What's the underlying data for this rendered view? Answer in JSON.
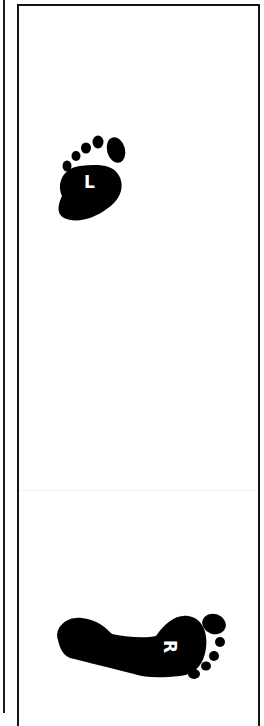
{
  "diagram": {
    "type": "footprint-placement-guide",
    "colors": {
      "ink": "#000000",
      "background": "#ffffff",
      "label": "#ffffff"
    },
    "footprints": [
      {
        "id": "left",
        "label": "L",
        "icon": "left-footprint-icon",
        "orientation": "toes-up"
      },
      {
        "id": "right",
        "label": "R",
        "icon": "right-footprint-icon",
        "orientation": "toes-right"
      }
    ]
  }
}
